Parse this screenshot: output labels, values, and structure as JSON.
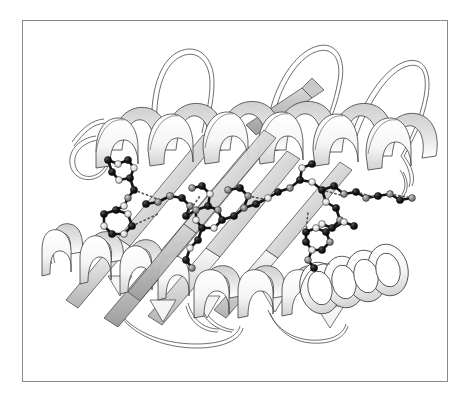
{
  "figure": {
    "kind": "protein-ribbon-diagram",
    "title": "",
    "caption": "",
    "background_color": "#ffffff",
    "frame": {
      "border_color": "#8a8a8a",
      "border_width_px": 1,
      "x": 22,
      "y": 20,
      "width": 426,
      "height": 362
    }
  },
  "rendering": {
    "style": "molscript-ribbon",
    "line_color": "#3a3a3a",
    "ribbon_fill_light": "#fdfdfd",
    "ribbon_fill_mid": "#d8d8d8",
    "ribbon_fill_dark": "#a9a9a9",
    "strand_fill_light": "#f2f2f2",
    "strand_fill_mid": "#cfcfcf",
    "strand_fill_dark": "#9a9a9a",
    "atom_dark_color": "#111111",
    "atom_mid_color": "#8d8d8d",
    "atom_light_color": "#e8e8e8",
    "bond_color": "#1a1a1a",
    "hbond_color": "#6a6a6a",
    "hbond_dash": "1,3"
  },
  "secondary_structure": {
    "helices": [
      {
        "name": "helix-top",
        "label": "α-helix (top, front)",
        "turns": 6,
        "orientation": "horizontal-left-to-right",
        "x_start": 96,
        "x_end": 400,
        "y": 125
      },
      {
        "name": "helix-lower-left",
        "label": "α-helix (lower left)",
        "turns": 3,
        "orientation": "descending-left",
        "x_start": 42,
        "x_end": 180,
        "y": 265
      },
      {
        "name": "helix-lower-center",
        "label": "α-helix (lower center)",
        "turns": 4,
        "orientation": "horizontal",
        "x_start": 180,
        "x_end": 330,
        "y": 290
      },
      {
        "name": "helix-lower-right",
        "label": "α-helix (lower right, end-on)",
        "turns": 4,
        "orientation": "end-on-cylinder",
        "x_start": 300,
        "x_end": 400,
        "y": 275
      }
    ],
    "strands": [
      {
        "name": "strand-1",
        "label": "β-strand 1",
        "direction": "lower-left-to-upper-right"
      },
      {
        "name": "strand-2",
        "label": "β-strand 2",
        "direction": "lower-left-to-upper-right"
      },
      {
        "name": "strand-3",
        "label": "β-strand 3",
        "direction": "lower-left-to-upper-right"
      },
      {
        "name": "strand-4",
        "label": "β-strand 4",
        "direction": "lower-left-to-upper-right"
      },
      {
        "name": "strand-5",
        "label": "β-strand 5 (top, short)",
        "direction": "lower-left-to-upper-right"
      }
    ],
    "loops": [
      {
        "name": "loop-top-left",
        "label": "loop (top left)"
      },
      {
        "name": "loop-top-center",
        "label": "loop (top center)"
      },
      {
        "name": "loop-top-right",
        "label": "loop (top right)"
      },
      {
        "name": "loop-far-right",
        "label": "loop (far right)"
      },
      {
        "name": "loop-bottom-left",
        "label": "loop (bottom left)"
      },
      {
        "name": "loop-bottom-center",
        "label": "loop (bottom center)"
      },
      {
        "name": "loop-bottom-right",
        "label": "loop (bottom right)"
      },
      {
        "name": "loop-left-small",
        "label": "small loop (left)"
      }
    ]
  },
  "side_chains": [
    {
      "name": "sidechain-left-upper",
      "type": "aromatic-ring",
      "atoms": 9
    },
    {
      "name": "sidechain-left-lower",
      "type": "aromatic-ring",
      "atoms": 9
    },
    {
      "name": "sidechain-center-left",
      "type": "branched-chain",
      "atoms": 8
    },
    {
      "name": "sidechain-center-ring",
      "type": "aromatic-ring",
      "atoms": 10
    },
    {
      "name": "sidechain-center-lower",
      "type": "extended-chain",
      "atoms": 7
    },
    {
      "name": "sidechain-center-right",
      "type": "branched-chain",
      "atoms": 9
    },
    {
      "name": "sidechain-right-upper",
      "type": "extended-chain",
      "atoms": 8
    },
    {
      "name": "sidechain-right-lower",
      "type": "aromatic-ring",
      "atoms": 9
    },
    {
      "name": "sidechain-far-right",
      "type": "extended-chain",
      "atoms": 7
    },
    {
      "name": "sidechain-bottom-right-cluster",
      "type": "ring-cluster",
      "atoms": 11
    }
  ],
  "hydrogen_bonds": [
    {
      "name": "hbond-1"
    },
    {
      "name": "hbond-2"
    },
    {
      "name": "hbond-3"
    },
    {
      "name": "hbond-4"
    },
    {
      "name": "hbond-5"
    },
    {
      "name": "hbond-6"
    },
    {
      "name": "hbond-7"
    }
  ]
}
